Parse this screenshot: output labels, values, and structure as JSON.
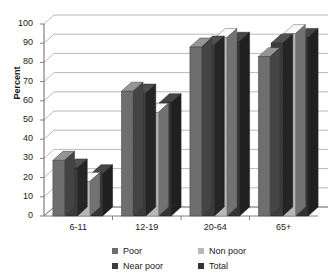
{
  "chart_data": {
    "type": "bar",
    "title": "",
    "subtitle": "",
    "xlabel": "",
    "ylabel": "Percent",
    "categories": [
      "6-11",
      "12-19",
      "20-64",
      "65+"
    ],
    "series": [
      {
        "name": "Poor",
        "color": "#6e6e6e",
        "values": [
          29,
          65,
          88,
          83
        ]
      },
      {
        "name": "Near poor",
        "color": "#3b3b3b",
        "values": [
          25,
          64,
          89,
          90
        ]
      },
      {
        "name": "Non poor",
        "color": "#b8b8b8",
        "values": [
          18,
          54,
          93,
          95
        ]
      },
      {
        "name": "Total",
        "color": "#333333",
        "values": [
          22,
          59,
          91,
          93
        ]
      }
    ],
    "ylim": [
      0,
      100
    ],
    "ytick_step": 10,
    "yticks": [
      "0",
      "10",
      "20",
      "30",
      "40",
      "50",
      "60",
      "70",
      "80",
      "90",
      "100"
    ],
    "grid": true,
    "grid_axis": "y",
    "legend_position": "bottom",
    "three_d": true,
    "plot_background": "#ffffff",
    "axis_color": "#808080",
    "grid_color": "#a8a8a8",
    "text_color": "#1a1a1a"
  },
  "axis": {
    "y_title": "Percent"
  },
  "legend": {
    "rows": [
      {
        "left": "Poor",
        "left_color": "#6e6e6e",
        "right": "Non poor",
        "right_color": "#b8b8b8"
      },
      {
        "left": "Near poor",
        "left_color": "#3b3b3b",
        "right": "Total",
        "right_color": "#333333"
      }
    ]
  }
}
